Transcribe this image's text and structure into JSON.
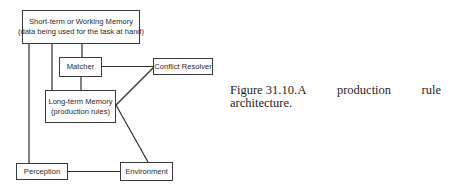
{
  "diagram": {
    "nodes": {
      "working_memory": {
        "line1": "Short-term or Working Memory",
        "line2": "(data being used for the task at hand)"
      },
      "matcher": {
        "label": "Matcher"
      },
      "conflict_resolver": {
        "label": "Conflict Resolver"
      },
      "long_term_memory": {
        "line1": "Long-term Memory",
        "line2": "(production rules)"
      },
      "perception": {
        "label": "Perception"
      },
      "environment": {
        "label": "Environment"
      }
    },
    "edges": [
      {
        "from": "working_memory",
        "to": "matcher"
      },
      {
        "from": "working_memory",
        "to": "long_term_memory"
      },
      {
        "from": "working_memory",
        "to": "perception"
      },
      {
        "from": "matcher",
        "to": "long_term_memory"
      },
      {
        "from": "matcher",
        "to": "conflict_resolver"
      },
      {
        "from": "long_term_memory",
        "to": "conflict_resolver"
      },
      {
        "from": "long_term_memory",
        "to": "environment"
      },
      {
        "from": "perception",
        "to": "environment"
      }
    ]
  },
  "caption": {
    "words_line1": [
      "Figure 31.10.",
      "A",
      "production",
      "rule"
    ],
    "line2": "architecture."
  }
}
